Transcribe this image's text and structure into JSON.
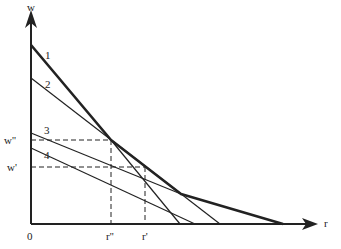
{
  "axes": {
    "y_label": "w",
    "x_label": "r",
    "origin_label": "0"
  },
  "y_ticks": [
    {
      "label": "w''",
      "y": 140
    },
    {
      "label": "w'",
      "y": 167
    }
  ],
  "x_ticks": [
    {
      "label": "r''",
      "x": 111
    },
    {
      "label": "r'",
      "x": 145
    }
  ],
  "curves": [
    {
      "label": "1",
      "weight": "thick"
    },
    {
      "label": "2",
      "weight": "thin"
    },
    {
      "label": "3",
      "weight": "thin"
    },
    {
      "label": "4",
      "weight": "thin"
    }
  ],
  "colors": {
    "line": "#222222",
    "background": "#ffffff"
  }
}
